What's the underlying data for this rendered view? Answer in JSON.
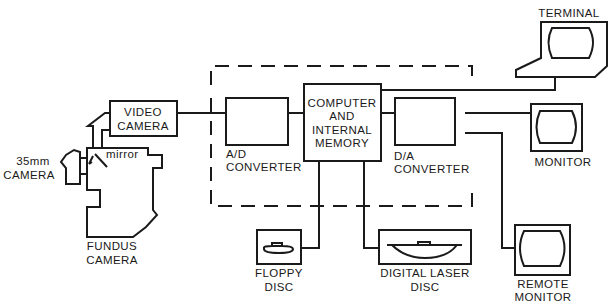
{
  "diagram": {
    "colors": {
      "ink": "#1a1a1a",
      "background": "#ffffff"
    },
    "components": {
      "video_camera": [
        "VIDEO",
        "CAMERA"
      ],
      "camera_35mm": [
        "35mm",
        "CAMERA"
      ],
      "mirror": "mirror",
      "fundus_camera": [
        "FUNDUS",
        "CAMERA"
      ],
      "ad_converter": [
        "A/D",
        "CONVERTER"
      ],
      "computer": [
        "COMPUTER",
        "AND",
        "INTERNAL",
        "MEMORY"
      ],
      "da_converter": [
        "D/A",
        "CONVERTER"
      ],
      "terminal": "TERMINAL",
      "monitor": "MONITOR",
      "floppy_disc": [
        "FLOPPY",
        "DISC"
      ],
      "laser_disc": [
        "DIGITAL LASER",
        "DISC"
      ],
      "remote_monitor": [
        "REMOTE",
        "MONITOR"
      ]
    },
    "connections": [
      [
        "video_camera",
        "ad_converter"
      ],
      [
        "ad_converter",
        "computer"
      ],
      [
        "computer",
        "da_converter"
      ],
      [
        "computer",
        "terminal"
      ],
      [
        "da_converter",
        "monitor"
      ],
      [
        "da_converter",
        "remote_monitor"
      ],
      [
        "computer",
        "floppy_disc"
      ],
      [
        "computer",
        "laser_disc"
      ]
    ]
  }
}
